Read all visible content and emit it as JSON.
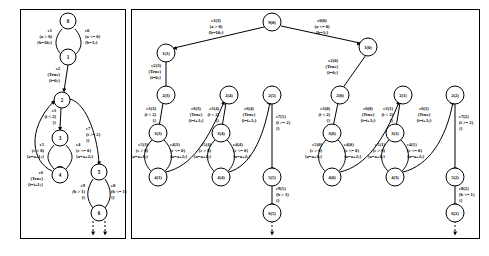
{
  "figure": {
    "kind": "state-transition-graph-and-unrolled-tree",
    "panels": [
      {
        "id": "left-panel",
        "name": "compact-state-machine"
      },
      {
        "id": "right-panel",
        "name": "unrolled-execution-tree"
      }
    ]
  },
  "left": {
    "nodes": [
      {
        "id": "L0",
        "label": "0",
        "cx": 68,
        "cy": 21
      },
      {
        "id": "L1",
        "label": "1",
        "cx": 68,
        "cy": 57
      },
      {
        "id": "L2",
        "label": "2",
        "cx": 62,
        "cy": 100
      },
      {
        "id": "L3",
        "label": "3",
        "cx": 60,
        "cy": 138
      },
      {
        "id": "L4",
        "label": "4",
        "cx": 60,
        "cy": 175
      },
      {
        "id": "L5",
        "label": "5",
        "cx": 99,
        "cy": 172
      },
      {
        "id": "L6",
        "label": "6",
        "cx": 99,
        "cy": 213
      }
    ],
    "edges": [
      {
        "id": "e1",
        "name": "e1",
        "lines": [
          "e1",
          "(a > 0)",
          "{b=10;}"
        ],
        "from": "0",
        "to": "1",
        "side": "left"
      },
      {
        "id": "e0",
        "name": "e0",
        "lines": [
          "e0",
          "(a <= 0)",
          "{b=1;}"
        ],
        "from": "0",
        "to": "1",
        "side": "right"
      },
      {
        "id": "e2",
        "name": "e2",
        "lines": [
          "e2",
          "(True)",
          "{i=0;}"
        ],
        "from": "1",
        "to": "2",
        "side": "left"
      },
      {
        "id": "e3",
        "name": "e3",
        "lines": [
          "e3",
          "(i < 2)",
          "{}"
        ],
        "from": "2",
        "to": "3",
        "side": "left"
      },
      {
        "id": "e7",
        "name": "e7",
        "lines": [
          "e7",
          "(i >= 2)",
          "{}"
        ],
        "from": "2",
        "to": "5",
        "side": "right"
      },
      {
        "id": "e5",
        "name": "e5",
        "lines": [
          "e5",
          "(c > 0)",
          "{a=a+1;}"
        ],
        "from": "3",
        "to": "4",
        "side": "left"
      },
      {
        "id": "e4",
        "name": "e4",
        "lines": [
          "e4",
          "(c <= 0)",
          "{a=a+2;}"
        ],
        "from": "3",
        "to": "4",
        "side": "right"
      },
      {
        "id": "e6",
        "name": "e6",
        "lines": [
          "e6",
          "(True)",
          "{i=i+1;}"
        ],
        "from": "4",
        "to": "2",
        "side": "left"
      },
      {
        "id": "e9",
        "name": "e9",
        "lines": [
          "e9",
          "(b > 1)",
          "{}"
        ],
        "from": "5",
        "to": "6",
        "side": "left"
      },
      {
        "id": "e8",
        "name": "e8",
        "lines": [
          "e8",
          "(b <= 1)",
          "{}"
        ],
        "from": "5",
        "to": "6",
        "side": "right"
      }
    ]
  },
  "right": {
    "nodes": [
      {
        "id": "R90",
        "label": "9(0)",
        "cx": 272,
        "cy": 22
      },
      {
        "id": "R11",
        "label": "1(1)",
        "cx": 166,
        "cy": 53
      },
      {
        "id": "R10",
        "label": "1(0)",
        "cx": 368,
        "cy": 47
      },
      {
        "id": "R23",
        "label": "2(3)",
        "cx": 166,
        "cy": 95
      },
      {
        "id": "R20",
        "label": "1(0)",
        "cx": 368,
        "cy": 47
      },
      {
        "id": "R24",
        "label": "2(4)",
        "cx": 229,
        "cy": 95
      },
      {
        "id": "R25",
        "label": "2(5)",
        "cx": 272,
        "cy": 95
      },
      {
        "id": "R2_0",
        "label": "2(0)",
        "cx": 340,
        "cy": 95
      },
      {
        "id": "R21",
        "label": "2(1)",
        "cx": 403,
        "cy": 95
      },
      {
        "id": "R22",
        "label": "2(2)",
        "cx": 455,
        "cy": 95
      },
      {
        "id": "R33",
        "label": "3(3)",
        "cx": 158,
        "cy": 133
      },
      {
        "id": "R34",
        "label": "3(4)",
        "cx": 221,
        "cy": 133
      },
      {
        "id": "R30",
        "label": "3(0)",
        "cx": 332,
        "cy": 133
      },
      {
        "id": "R31",
        "label": "3(1)",
        "cx": 395,
        "cy": 133
      },
      {
        "id": "R41",
        "label": "4(1)",
        "cx": 158,
        "cy": 177
      },
      {
        "id": "R44",
        "label": "4(4)",
        "cx": 221,
        "cy": 177
      },
      {
        "id": "R40",
        "label": "4(0)",
        "cx": 332,
        "cy": 177
      },
      {
        "id": "R43",
        "label": "4(3)",
        "cx": 395,
        "cy": 177
      },
      {
        "id": "R55",
        "label": "5(5)",
        "cx": 272,
        "cy": 177
      },
      {
        "id": "R52",
        "label": "5(2)",
        "cx": 455,
        "cy": 177
      },
      {
        "id": "R65",
        "label": "6(5)",
        "cx": 272,
        "cy": 213
      },
      {
        "id": "R62",
        "label": "6(2)",
        "cx": 455,
        "cy": 213
      }
    ],
    "edges": [
      {
        "id": "e1_3",
        "name": "e1(3)",
        "lines": [
          "e1(3)",
          "(a > 0)",
          "{b=10;}"
        ],
        "from": "9(0)",
        "to": "1(1)"
      },
      {
        "id": "e0_0",
        "name": "e0(0)",
        "lines": [
          "e0(0)",
          "(a <= 0)",
          "{b=1;}"
        ],
        "from": "9(0)",
        "to": "1(0)"
      },
      {
        "id": "e2_3",
        "name": "e2(3)",
        "lines": [
          "e2(3)",
          "(True)",
          "{i=0;}"
        ],
        "from": "1(1)",
        "to": "2(3)"
      },
      {
        "id": "e2_0",
        "name": "e2(0)",
        "lines": [
          "e2(0)",
          "(True)",
          "{i=0;}"
        ],
        "from": "1(0)",
        "to": "2(0)"
      },
      {
        "id": "e3_3",
        "name": "e3(3)",
        "lines": [
          "e3(3)",
          "(i < 2)",
          "{}"
        ],
        "from": "2(3)",
        "to": "3(3)"
      },
      {
        "id": "e6_3",
        "name": "e6(3)",
        "lines": [
          "e6(3)",
          "(True)",
          "{i=i+1;}"
        ],
        "from": "4(1)",
        "to": "2(4)"
      },
      {
        "id": "e3_4",
        "name": "e3(4)",
        "lines": [
          "e3(4)",
          "(i < 2)",
          "{}"
        ],
        "from": "2(4)",
        "to": "3(4)"
      },
      {
        "id": "e6_4",
        "name": "e6(4)",
        "lines": [
          "e6(4)",
          "(True)",
          "{i=i+1;}"
        ],
        "from": "4(4)",
        "to": "2(5)"
      },
      {
        "id": "e7_5",
        "name": "e7(5)",
        "lines": [
          "e7(5)",
          "(i >= 2)",
          "{}"
        ],
        "from": "2(5)",
        "to": "5(5)"
      },
      {
        "id": "e5_3",
        "name": "e5(3)",
        "lines": [
          "e5(3)",
          "(c > 0)",
          "{a=a+1;}"
        ],
        "from": "3(3)",
        "to": "4(1)"
      },
      {
        "id": "e4_3",
        "name": "e4(3)",
        "lines": [
          "e4(3)",
          "(c <= 0)",
          "{a=a+2;}"
        ],
        "from": "3(3)",
        "to": "4(1)"
      },
      {
        "id": "e5_4",
        "name": "e5(4)",
        "lines": [
          "e5(4)",
          "(c > 0)",
          "{a=a+1;}"
        ],
        "from": "3(4)",
        "to": "4(4)"
      },
      {
        "id": "e4_4",
        "name": "e4(4)",
        "lines": [
          "e4(4)",
          "(c <= 0)",
          "{a=a+2;}"
        ],
        "from": "3(4)",
        "to": "4(4)"
      },
      {
        "id": "e3_0",
        "name": "e3(0)",
        "lines": [
          "e3(0)",
          "(i < 2)",
          "{}"
        ],
        "from": "2(0)",
        "to": "3(0)"
      },
      {
        "id": "e6_0",
        "name": "e6(0)",
        "lines": [
          "e6(0)",
          "(True)",
          "{i=i+1;}"
        ],
        "from": "4(0)",
        "to": "2(1)"
      },
      {
        "id": "e3_1",
        "name": "e3(1)",
        "lines": [
          "e3(1)",
          "(i < 2)",
          "{}"
        ],
        "from": "2(1)",
        "to": "3(1)"
      },
      {
        "id": "e6_1",
        "name": "e6(1)",
        "lines": [
          "e6(1)",
          "(True)",
          "{i=i+1;}"
        ],
        "from": "4(3)",
        "to": "2(2)"
      },
      {
        "id": "e7_2",
        "name": "e7(2)",
        "lines": [
          "e7(2)",
          "(i >= 2)",
          "{}"
        ],
        "from": "2(2)",
        "to": "5(2)"
      },
      {
        "id": "e5_0",
        "name": "e5(0)",
        "lines": [
          "e5(0)",
          "(c > 0)",
          "{a=a+1;}"
        ],
        "from": "3(0)",
        "to": "4(0)"
      },
      {
        "id": "e4_0",
        "name": "e4(0)",
        "lines": [
          "e4(0)",
          "(c <= 0)",
          "{a=a+2;}"
        ],
        "from": "3(0)",
        "to": "4(0)"
      },
      {
        "id": "e5_1",
        "name": "e5(1)",
        "lines": [
          "e5(1)",
          "(c > 0)",
          "{a=a+1;}"
        ],
        "from": "3(1)",
        "to": "4(3)"
      },
      {
        "id": "e4_1",
        "name": "e4(1)",
        "lines": [
          "e4(1)",
          "(c <= 0)",
          "{a=a+2;}"
        ],
        "from": "3(1)",
        "to": "4(3)"
      },
      {
        "id": "e9_5",
        "name": "e9(5)",
        "lines": [
          "e9(5)",
          "(b > 1)",
          "{}"
        ],
        "from": "5(5)",
        "to": "6(5)"
      },
      {
        "id": "e8_2",
        "name": "e8(2)",
        "lines": [
          "e8(2)",
          "(b <= 1)",
          "{}"
        ],
        "from": "5(2)",
        "to": "6(2)"
      }
    ]
  }
}
